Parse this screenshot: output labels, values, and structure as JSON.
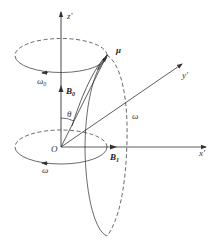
{
  "diagram": {
    "type": "vector-rotating-frame",
    "stroke_color": "#333333",
    "axes": {
      "z": {
        "label": "z'"
      },
      "y": {
        "label": "y'"
      },
      "x": {
        "label": "x'"
      },
      "origin": {
        "label": "O"
      }
    },
    "vectors": {
      "mu": {
        "label": "μ"
      },
      "B0": {
        "label": "B",
        "subscript": "0"
      },
      "B1": {
        "label": "B",
        "subscript": "1"
      }
    },
    "angle": {
      "label": "θ"
    },
    "rotations": {
      "top_precession": {
        "label": "ω",
        "subscript": "0"
      },
      "bottom_rotation": {
        "label": "ω"
      },
      "nutation": {
        "label": "ω"
      }
    }
  }
}
